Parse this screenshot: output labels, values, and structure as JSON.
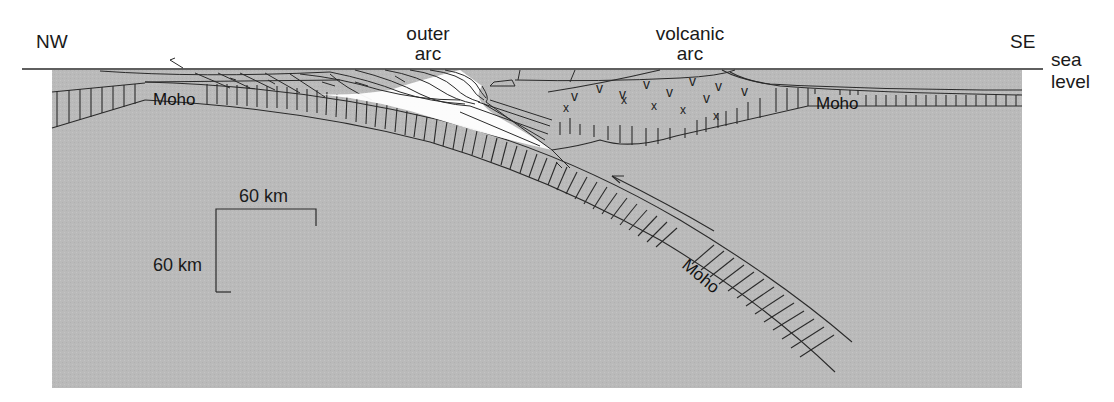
{
  "figure": {
    "type": "cross-section",
    "colors": {
      "background": "#ffffff",
      "mantle_fill": "#b9b9b9",
      "wedge_highlight": "#ffffff",
      "line": "#2a2a2a"
    }
  },
  "labels": {
    "nw": "NW",
    "se": "SE",
    "outer_arc_line1": "outer",
    "outer_arc_line2": "arc",
    "volcanic_arc_line1": "volcanic",
    "volcanic_arc_line2": "arc",
    "sea_level_line1": "sea",
    "sea_level_line2": "level"
  },
  "moho_labels": {
    "left": "Moho",
    "right": "Moho",
    "slab": "Moho"
  },
  "scale_bar": {
    "horizontal_label": "60 km",
    "vertical_label": "60 km"
  },
  "volcanic_symbols": {
    "v_marks": [
      "v",
      "v",
      "v",
      "v",
      "v",
      "v",
      "v",
      "v",
      "v"
    ],
    "x_marks": [
      "x",
      "x",
      "x",
      "x",
      "x"
    ]
  }
}
